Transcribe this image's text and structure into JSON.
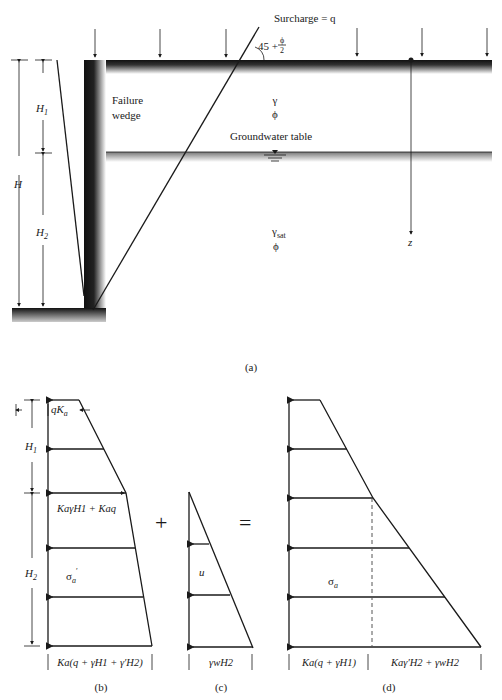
{
  "figure_a": {
    "caption": "(a)",
    "surcharge_label": "Surcharge = q",
    "angle_label": {
      "prefix": "45 + ",
      "num": "ϕ",
      "den": "2"
    },
    "failure_wedge": [
      "Failure",
      "wedge"
    ],
    "upper_soil": {
      "gamma": "γ",
      "phi": "ϕ"
    },
    "groundwater_label": "Groundwater table",
    "lower_soil": {
      "gamma": "γ",
      "gamma_sub": "sat",
      "phi": "ϕ"
    },
    "depth_axis": "z",
    "dims": {
      "H": "H",
      "H1": "H",
      "H1_sub": "1",
      "H2": "H",
      "H2_sub": "2"
    }
  },
  "figure_b": {
    "caption": "(b)",
    "top_label": {
      "a": "qK",
      "a_sub": "a"
    },
    "mid_label": "KaγH1 + Kaq",
    "stress_label": {
      "sym": "σ",
      "sub": "a",
      "prime": "′"
    },
    "bottom_label": "Ka(q + γH1 + γ′H2)",
    "dims": {
      "H1": "H",
      "H1_sub": "1",
      "H2": "H",
      "H2_sub": "2"
    }
  },
  "operators": {
    "plus": "+",
    "equals": "="
  },
  "figure_c": {
    "caption": "(c)",
    "stress_label": "u",
    "bottom_label": "γwH2"
  },
  "figure_d": {
    "caption": "(d)",
    "stress_label": {
      "sym": "σ",
      "sub": "a"
    },
    "bottom_left_label": "Ka(q + γH1)",
    "bottom_right_label": "Kaγ′H2 + γwH2"
  }
}
